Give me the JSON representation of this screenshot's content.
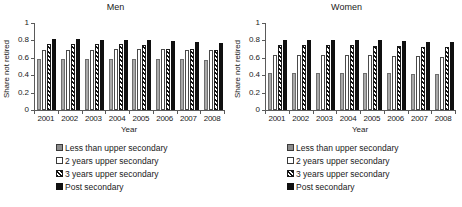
{
  "chart_data": [
    {
      "type": "bar",
      "title": "Men",
      "xlabel": "Year",
      "ylabel": "Share not retired",
      "ylim": [
        0,
        1
      ],
      "yticks": [
        "0",
        "0.2",
        "0.4",
        "0.6",
        "0.8",
        "1"
      ],
      "grid": false,
      "legend_position": "below",
      "categories": [
        "2001",
        "2002",
        "2003",
        "2004",
        "2005",
        "2006",
        "2007",
        "2008"
      ],
      "series": [
        {
          "name": "Less than upper secondary",
          "values": [
            0.59,
            0.59,
            0.585,
            0.59,
            0.59,
            0.59,
            0.585,
            0.575
          ]
        },
        {
          "name": "2 years upper secondary",
          "values": [
            0.69,
            0.69,
            0.695,
            0.7,
            0.7,
            0.7,
            0.69,
            0.69
          ]
        },
        {
          "name": "3 years upper secondary",
          "values": [
            0.755,
            0.755,
            0.755,
            0.755,
            0.745,
            0.7,
            0.7,
            0.695
          ]
        },
        {
          "name": "Post secondary",
          "values": [
            0.815,
            0.815,
            0.81,
            0.81,
            0.805,
            0.795,
            0.785,
            0.775
          ]
        }
      ]
    },
    {
      "type": "bar",
      "title": "Women",
      "xlabel": "Year",
      "ylabel": "Share not retired",
      "ylim": [
        0,
        1
      ],
      "yticks": [
        "0",
        "0.2",
        "0.4",
        "0.6",
        "0.8",
        "1"
      ],
      "grid": false,
      "legend_position": "below",
      "categories": [
        "2001",
        "2002",
        "2003",
        "2004",
        "2005",
        "2006",
        "2007",
        "2008"
      ],
      "series": [
        {
          "name": "Less than upper secondary",
          "values": [
            0.43,
            0.43,
            0.425,
            0.425,
            0.42,
            0.42,
            0.415,
            0.41
          ]
        },
        {
          "name": "2 years upper secondary",
          "values": [
            0.63,
            0.635,
            0.63,
            0.63,
            0.63,
            0.625,
            0.62,
            0.61
          ]
        },
        {
          "name": "3 years upper secondary",
          "values": [
            0.745,
            0.75,
            0.745,
            0.745,
            0.74,
            0.735,
            0.73,
            0.725
          ]
        },
        {
          "name": "Post secondary",
          "values": [
            0.805,
            0.8,
            0.8,
            0.8,
            0.8,
            0.795,
            0.785,
            0.78
          ]
        }
      ]
    }
  ],
  "legend": {
    "items": [
      {
        "label": "Less than upper secondary",
        "swatch": "gray-filled-square-icon"
      },
      {
        "label": "2 years upper secondary",
        "swatch": "white-square-icon"
      },
      {
        "label": "3 years upper secondary",
        "swatch": "hatched-square-icon"
      },
      {
        "label": "Post secondary",
        "swatch": "black-square-icon"
      }
    ]
  }
}
